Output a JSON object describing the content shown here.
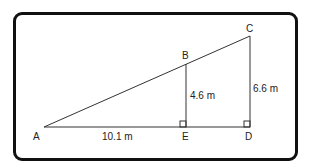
{
  "diagram": {
    "type": "similar-triangles",
    "points": {
      "A": {
        "label": "A",
        "x": 44,
        "y": 127
      },
      "B": {
        "label": "B",
        "x": 186,
        "y": 64
      },
      "C": {
        "label": "C",
        "x": 250,
        "y": 36
      },
      "D": {
        "label": "D",
        "x": 250,
        "y": 127
      },
      "E": {
        "label": "E",
        "x": 186,
        "y": 127
      }
    },
    "measurements": {
      "AE": "10.1 m",
      "BE": "4.6 m",
      "CD": "6.6 m"
    },
    "right_angles": [
      "E",
      "D"
    ],
    "colors": {
      "line": "#333333",
      "border": "#111111"
    }
  }
}
